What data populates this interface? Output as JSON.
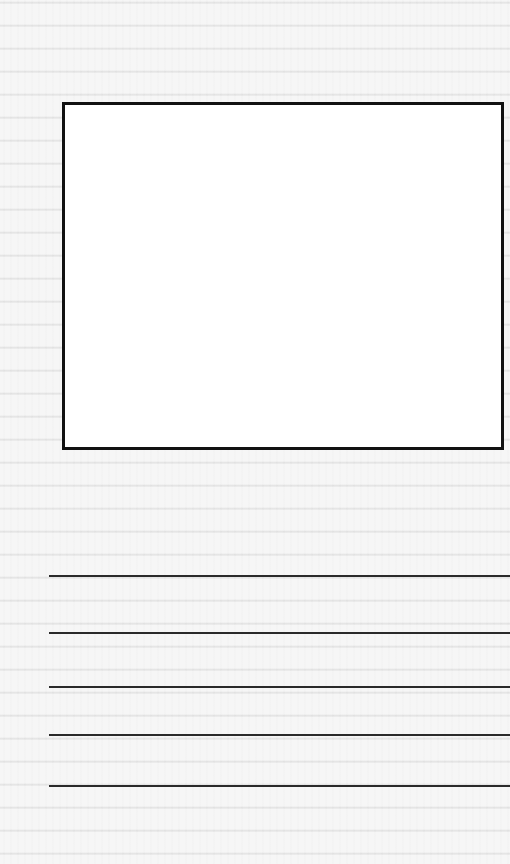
{
  "document": {
    "type": "drawing-and-writing-template",
    "picture_box": {
      "label": "",
      "border_color": "#111111",
      "fill_color": "#ffffff"
    },
    "writing_lines": [
      {
        "index": 1,
        "top": 575,
        "text": ""
      },
      {
        "index": 2,
        "top": 632,
        "text": ""
      },
      {
        "index": 3,
        "top": 686,
        "text": ""
      },
      {
        "index": 4,
        "top": 734,
        "text": ""
      },
      {
        "index": 5,
        "top": 785,
        "text": ""
      }
    ],
    "line_color": "#2a2a2a",
    "background_color": "#ececec"
  }
}
